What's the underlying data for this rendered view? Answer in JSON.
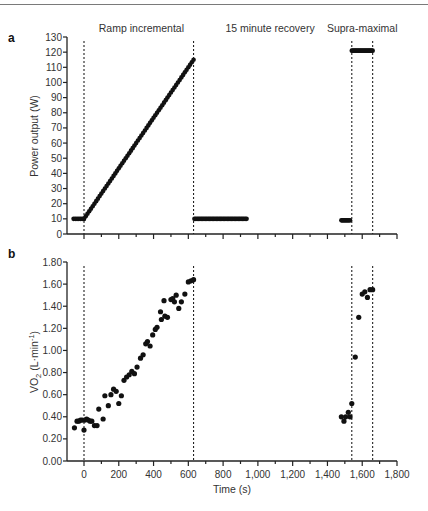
{
  "chart_data": [
    {
      "panel": "a",
      "type": "scatter",
      "ylabel": "Power output (W)",
      "xlabel": "",
      "xlim": [
        -100,
        1800
      ],
      "ylim": [
        0,
        130
      ],
      "yticks": [
        0,
        10,
        20,
        30,
        40,
        50,
        60,
        70,
        80,
        90,
        100,
        110,
        120,
        130
      ],
      "ytick_labels": [
        "0",
        "10",
        "20",
        "30",
        "40",
        "50",
        "60",
        "70",
        "80",
        "90",
        "100",
        "110",
        "120",
        "130"
      ],
      "xticks": [
        0,
        200,
        400,
        600,
        800,
        1000,
        1200,
        1400,
        1600,
        1800
      ],
      "phase_labels": [
        {
          "text": "Ramp incremental",
          "x": 330
        },
        {
          "text": "15 minute recovery",
          "x": 1070
        },
        {
          "text": "Supra-maximal",
          "x": 1600
        }
      ],
      "vlines": [
        0,
        630,
        1540,
        1660
      ],
      "segments": [
        {
          "name": "baseline",
          "x_start": -60,
          "x_end": 0,
          "y_start": 10,
          "y_end": 10,
          "step": 10
        },
        {
          "name": "ramp",
          "x_start": 0,
          "x_end": 630,
          "y_start": 10,
          "y_end": 115,
          "step": 10
        },
        {
          "name": "recovery",
          "x_start": 635,
          "x_end": 935,
          "y_start": 10,
          "y_end": 10,
          "step": 8
        },
        {
          "name": "pre-supra",
          "x_start": 1480,
          "x_end": 1530,
          "y_start": 9,
          "y_end": 9,
          "step": 6
        },
        {
          "name": "supra-maximal",
          "x_start": 1540,
          "x_end": 1660,
          "y_start": 121,
          "y_end": 121,
          "step": 6
        }
      ]
    },
    {
      "panel": "b",
      "type": "scatter",
      "ylabel": "VO2 (L·min-1)",
      "ylabel_main": "VO",
      "ylabel_sub": "2",
      "ylabel_rest": " (L·min",
      "ylabel_sup": "-1",
      "ylabel_close": ")",
      "xlabel": "Time (s)",
      "xlim": [
        -100,
        1800
      ],
      "ylim": [
        0,
        1.8
      ],
      "yticks": [
        0,
        0.2,
        0.4,
        0.6,
        0.8,
        1.0,
        1.2,
        1.4,
        1.6,
        1.8
      ],
      "ytick_labels": [
        "0.00",
        "0.20",
        "0.40",
        "0.60",
        "0.80",
        "1.00",
        "1.20",
        "1.40",
        "1.60",
        "1.80"
      ],
      "xticks": [
        0,
        200,
        400,
        600,
        800,
        1000,
        1200,
        1400,
        1600,
        1800
      ],
      "xtick_labels": [
        "0",
        "200",
        "400",
        "600",
        "800",
        "1,000",
        "1,200",
        "1,400",
        "1,600",
        "1,800"
      ],
      "vlines": [
        0,
        630,
        1540,
        1660
      ],
      "points": [
        [
          -55,
          0.3
        ],
        [
          -40,
          0.36
        ],
        [
          -30,
          0.36
        ],
        [
          -20,
          0.37
        ],
        [
          -10,
          0.37
        ],
        [
          0,
          0.28
        ],
        [
          5,
          0.37
        ],
        [
          15,
          0.38
        ],
        [
          25,
          0.37
        ],
        [
          35,
          0.36
        ],
        [
          45,
          0.36
        ],
        [
          60,
          0.32
        ],
        [
          75,
          0.32
        ],
        [
          85,
          0.47
        ],
        [
          110,
          0.38
        ],
        [
          120,
          0.59
        ],
        [
          140,
          0.5
        ],
        [
          155,
          0.6
        ],
        [
          170,
          0.65
        ],
        [
          185,
          0.63
        ],
        [
          200,
          0.52
        ],
        [
          215,
          0.59
        ],
        [
          230,
          0.73
        ],
        [
          245,
          0.76
        ],
        [
          260,
          0.78
        ],
        [
          275,
          0.81
        ],
        [
          290,
          0.79
        ],
        [
          305,
          0.85
        ],
        [
          325,
          0.93
        ],
        [
          340,
          0.96
        ],
        [
          355,
          1.06
        ],
        [
          365,
          1.08
        ],
        [
          380,
          1.04
        ],
        [
          395,
          1.14
        ],
        [
          410,
          1.19
        ],
        [
          420,
          1.21
        ],
        [
          440,
          1.35
        ],
        [
          445,
          1.28
        ],
        [
          460,
          1.45
        ],
        [
          465,
          1.31
        ],
        [
          480,
          1.3
        ],
        [
          500,
          1.46
        ],
        [
          510,
          1.47
        ],
        [
          520,
          1.44
        ],
        [
          530,
          1.5
        ],
        [
          545,
          1.38
        ],
        [
          560,
          1.44
        ],
        [
          580,
          1.51
        ],
        [
          600,
          1.62
        ],
        [
          615,
          1.63
        ],
        [
          630,
          1.64
        ],
        [
          1480,
          0.4
        ],
        [
          1495,
          0.36
        ],
        [
          1505,
          0.4
        ],
        [
          1520,
          0.44
        ],
        [
          1530,
          0.4
        ],
        [
          1540,
          0.52
        ],
        [
          1560,
          0.94
        ],
        [
          1580,
          1.3
        ],
        [
          1600,
          1.51
        ],
        [
          1615,
          1.53
        ],
        [
          1630,
          1.48
        ],
        [
          1645,
          1.55
        ],
        [
          1660,
          1.55
        ]
      ]
    }
  ]
}
